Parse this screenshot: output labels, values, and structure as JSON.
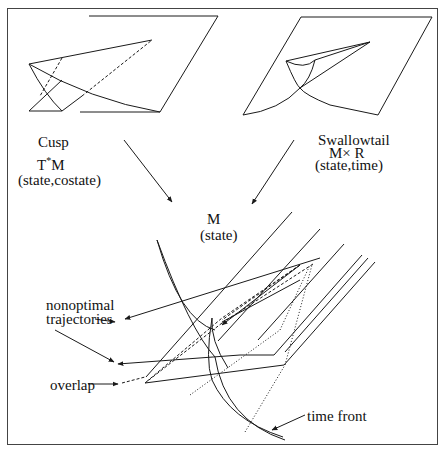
{
  "figure": {
    "cusp": {
      "title": "Cusp",
      "space_base": "T",
      "space_sup": "*",
      "space_rest": "M",
      "coords": "(state,costate)"
    },
    "swallowtail": {
      "title": "Swallowtail",
      "space": "M× R",
      "coords": "(state,time)"
    },
    "state_space": {
      "space": "M",
      "coords": "(state)"
    },
    "annotations": {
      "nonoptimal_line1": "nonoptimal",
      "nonoptimal_line2": "trajectories",
      "overlap": "overlap",
      "time_front": "time front"
    },
    "colors": {
      "line": "#1a1a1a",
      "frame": "#444444",
      "background": "#ffffff"
    }
  }
}
